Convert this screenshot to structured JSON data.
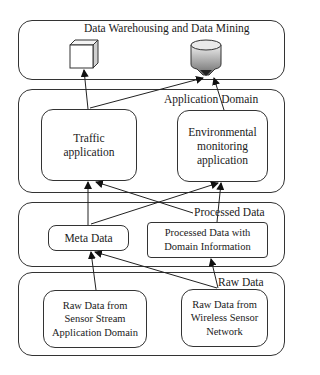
{
  "layers": {
    "warehouse": {
      "label": "Data Warehousing and Data Mining"
    },
    "application": {
      "label": "Application Domain"
    },
    "processed": {
      "label": "Processed Data"
    },
    "raw": {
      "label": "Raw Data"
    }
  },
  "nodes": {
    "warehouse_cube": {
      "icon": "cube-icon"
    },
    "warehouse_db": {
      "icon": "database-cylinder-icon"
    },
    "traffic": {
      "label": "Traffic\napplication"
    },
    "environmental": {
      "label": "Environmental\nmonitoring\napplication"
    },
    "meta": {
      "label": "Meta Data"
    },
    "processed_domain": {
      "label": "Processed Data with\nDomain Information"
    },
    "raw_sensor_stream": {
      "label": "Raw Data from\nSensor Stream\nApplication Domain"
    },
    "raw_wsn": {
      "label": "Raw Data from\nWireless Sensor\nNetwork"
    }
  },
  "edges": [
    {
      "from": "traffic",
      "to": "warehouse_cube"
    },
    {
      "from": "traffic",
      "to": "warehouse_db"
    },
    {
      "from": "environmental",
      "to": "warehouse_db"
    },
    {
      "from": "meta",
      "to": "traffic"
    },
    {
      "from": "meta",
      "to": "environmental"
    },
    {
      "from": "processed_domain",
      "to": "traffic"
    },
    {
      "from": "processed_domain",
      "to": "environmental"
    },
    {
      "from": "raw_sensor_stream",
      "to": "meta"
    },
    {
      "from": "raw_wsn",
      "to": "meta"
    },
    {
      "from": "raw_wsn",
      "to": "processed_domain"
    }
  ],
  "colors": {
    "stroke": "#333333",
    "db_light": "#e6e6e6",
    "db_dark": "#7a7a7a"
  }
}
